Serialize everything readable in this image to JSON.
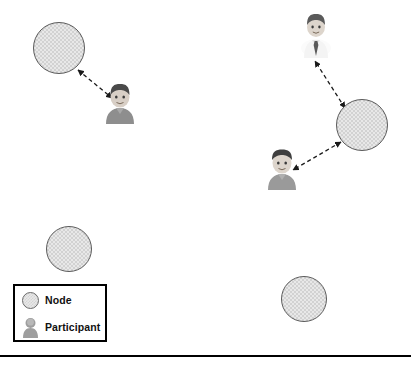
{
  "figure": {
    "background_color": "#ffffff",
    "width": 411,
    "height": 366
  },
  "legend": {
    "name": "legend-box",
    "border_color": "#000000",
    "background_color": "#ffffff",
    "items": [
      {
        "icon": "node-circle-icon",
        "label": "Node",
        "color": "#e0e0e0"
      },
      {
        "icon": "participant-person-icon",
        "label": "Participant",
        "color": "#9a9a9a"
      }
    ]
  },
  "nodes": [
    {
      "id": "node-top-left",
      "label": "",
      "cx": 59,
      "cy": 48,
      "r": 26
    },
    {
      "id": "node-mid-left",
      "label": "",
      "cx": 69,
      "cy": 249,
      "r": 23
    },
    {
      "id": "node-right-center",
      "label": "",
      "cx": 362,
      "cy": 125,
      "r": 26
    },
    {
      "id": "node-bottom-right",
      "label": "",
      "cx": 304,
      "cy": 299,
      "r": 23
    }
  ],
  "participants": [
    {
      "id": "participant-left",
      "label": "",
      "x": 103,
      "y": 82,
      "shirt": "#8e8e8e",
      "hair": "#4a4a4a"
    },
    {
      "id": "participant-right-top",
      "label": "",
      "x": 300,
      "y": 12,
      "shirt": "#f2f2f2",
      "hair": "#5a5a5a"
    },
    {
      "id": "participant-right-bottom",
      "label": "",
      "x": 265,
      "y": 148,
      "shirt": "#9a9a9a",
      "hair": "#3f3f3f"
    }
  ],
  "links": [
    {
      "id": "link-node-top-left--participant-left",
      "from": "node-top-left",
      "to": "participant-left",
      "style": "dashed",
      "arrows": "both"
    },
    {
      "id": "link-node-right-center--participant-right-top",
      "from": "node-right-center",
      "to": "participant-right-top",
      "style": "dashed",
      "arrows": "both"
    },
    {
      "id": "link-node-right-center--participant-right-bot",
      "from": "node-right-center",
      "to": "participant-right-bottom",
      "style": "dashed",
      "arrows": "both"
    }
  ],
  "styles": {
    "link_color": "#1a1a1a",
    "node_fill": "#e2e2e2",
    "node_stroke": "#5a5a5a",
    "rule_color": "#000000"
  }
}
